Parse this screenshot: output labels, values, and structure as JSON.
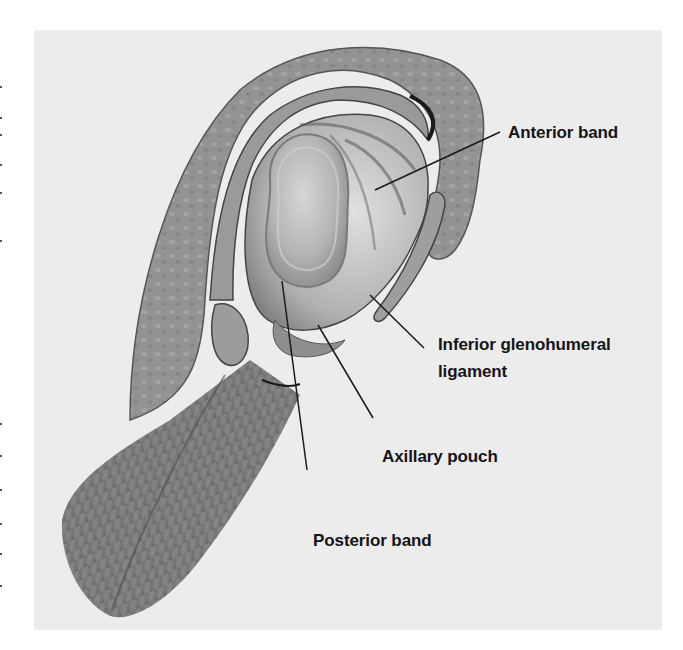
{
  "figure": {
    "colors": {
      "background": "#ffffff",
      "panel": "#ececec",
      "tissue_outer": "#8f8f8f",
      "tissue_band": "#9d9d9d",
      "capsule": "#c4c4c4",
      "humeral_head": "#b8b8b8",
      "muscle": "#7a7a7a",
      "leader_line": "#1a1a1a",
      "label_text": "#151515"
    }
  },
  "labels": {
    "anterior_band": "Anterior band",
    "inferior_glenohumeral_line1": "Inferior glenohumeral",
    "inferior_glenohumeral_line2": "ligament",
    "axillary_pouch": "Axillary pouch",
    "posterior_band": "Posterior band"
  }
}
